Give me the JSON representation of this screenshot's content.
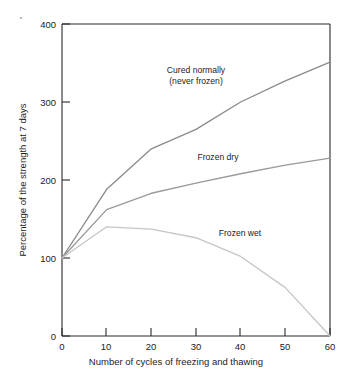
{
  "chart_data": {
    "type": "line",
    "title": "",
    "xlabel": "Number of cycles of freezing and thawing",
    "ylabel": "Percentage of the strength at 7 days",
    "xlim": [
      0,
      60
    ],
    "ylim": [
      0,
      400
    ],
    "xticks": [
      0,
      10,
      20,
      30,
      40,
      50,
      60
    ],
    "yticks": [
      0,
      100,
      200,
      300,
      400
    ],
    "xticklabels": [
      "0",
      "10",
      "20",
      "30",
      "40",
      "50",
      "60"
    ],
    "yticklabels": [
      "0",
      "100",
      "200",
      "300",
      "400"
    ],
    "grid": false,
    "legend": "inline-annotations",
    "x": [
      0,
      10,
      20,
      30,
      40,
      50,
      60
    ],
    "series": [
      {
        "name": "Cured normally (never frozen)",
        "label_lines": [
          "Cured normally",
          "(never frozen)"
        ],
        "color": "#8a8a8a",
        "values": [
          100,
          188,
          240,
          265,
          300,
          327,
          351
        ]
      },
      {
        "name": "Frozen dry",
        "label_lines": [
          "Frozen dry"
        ],
        "color": "#9a9a9a",
        "values": [
          100,
          162,
          183,
          196,
          208,
          219,
          228
        ]
      },
      {
        "name": "Frozen wet",
        "label_lines": [
          "Frozen wet"
        ],
        "color": "#c6c6c6",
        "values": [
          100,
          140,
          137,
          126,
          102,
          62,
          0
        ]
      }
    ]
  },
  "annotations": {
    "cured_normally_line1": "Cured normally",
    "cured_normally_line2": "(never frozen)",
    "frozen_dry": "Frozen dry",
    "frozen_wet": "Frozen wet"
  },
  "axes": {
    "x_title": "Number of cycles of freezing and thawing",
    "y_title": "Percentage of the strength at 7 days",
    "x_tick_0": "0",
    "x_tick_10": "10",
    "x_tick_20": "20",
    "x_tick_30": "30",
    "x_tick_40": "40",
    "x_tick_50": "50",
    "x_tick_60": "60",
    "y_tick_0": "0",
    "y_tick_100": "100",
    "y_tick_200": "200",
    "y_tick_300": "300",
    "y_tick_400": "400"
  },
  "colors": {
    "background": "#ffffff",
    "axis": "#2a2a2a",
    "series_cured": "#8a8a8a",
    "series_dry": "#9a9a9a",
    "series_wet": "#c6c6c6"
  }
}
